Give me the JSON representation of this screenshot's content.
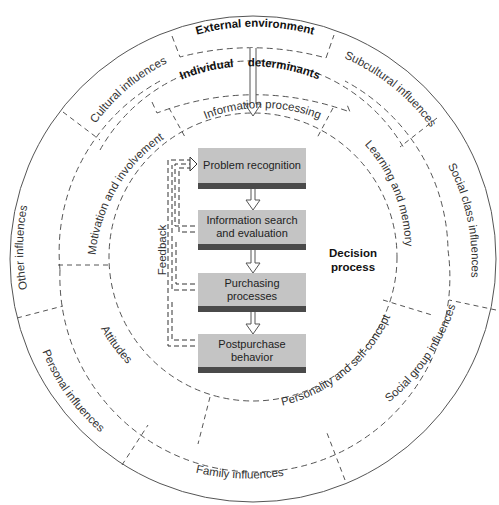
{
  "rings": {
    "external": {
      "title": "External environment",
      "segments": [
        "Cultural influences",
        "Subcultural influences",
        "Social class influences",
        "Social group influences",
        "Family influences",
        "Personal influences",
        "Other influences"
      ]
    },
    "individual": {
      "title_left": "Individual",
      "title_right": "determinants",
      "segments": [
        "Information processing",
        "Learning and memory",
        "Personality and self-concept",
        "Attitudes",
        "Motivation and involvement"
      ]
    }
  },
  "decision_process": {
    "title_line1": "Decision",
    "title_line2": "process",
    "steps": [
      {
        "line1": "Problem recognition",
        "line2": ""
      },
      {
        "line1": "Information search",
        "line2": "and evaluation"
      },
      {
        "line1": "Purchasing",
        "line2": "processes"
      },
      {
        "line1": "Postpurchase",
        "line2": "behavior"
      }
    ],
    "feedback_label": "Feedback"
  },
  "colors": {
    "box_fill": "#c4c4c4",
    "box_bar": "#4a4a4a",
    "line": "#555555"
  }
}
